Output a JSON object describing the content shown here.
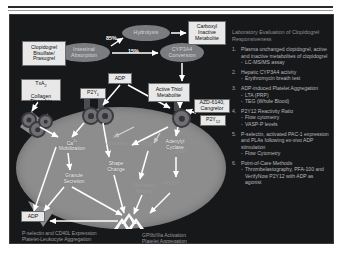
{
  "slide": {
    "background_color": "#17181a",
    "cell_color": "#8d8d8d"
  },
  "pathway": {
    "drug_box": "Clopidogrel\nBisulfate/\nPrasugrel",
    "drug_box_lines": [
      "Clopidogrel",
      "Bisulfate/",
      "Prasugrel"
    ],
    "intestinal": "Intestinal\nAbsorption",
    "hydrolysis": "Hydrolysis",
    "cyp3a4": "CYP3A4\nConversion",
    "carboxyl": "Carboxyl\nInactive\nMetabolite",
    "active_thiol": "Active Thiol\nMetabolite",
    "adp_top": "ADP",
    "adp_bottom": "ADP",
    "azd": "AZD-6140,\nCangrelor",
    "pct_hydrolysis": "85%",
    "pct_cyp": "15%"
  },
  "receptors": {
    "txa2_box": "TxA",
    "txa2_sub": "2",
    "txa2_rest": "Collagen\nThrombin",
    "txa2_lines": [
      "TxA2",
      "Collagen",
      "Thrombin"
    ],
    "p2y1": "P2Y",
    "p2y1_sub": "1",
    "p2y12": "P2Y",
    "p2y12_sub": "12"
  },
  "intracellular": {
    "ca_mobilization": "Ca2+\nMobilization",
    "ca_main": "Ca",
    "ca_sup": "2+",
    "ca_second": "Mobilization",
    "granule_secretion": "Granule\nSecretion",
    "shape_change": "Shape\nChange",
    "adenylyl_cyclase": "Adenylyl\nCyclase",
    "pkc": "PKC\nActivation",
    "pi3k": "PI3K",
    "camp": "cAMP",
    "fibrinogen": "Fibrinogen\nBinding",
    "vasp": "VASP-P",
    "pls": "+"
  },
  "captions": {
    "left": "P-selectin and CD40L Expression\nPlatelet-Leukocyte Aggregation",
    "left_lines": [
      "P-selectin and CD40L Expression",
      "Platelet-Leukocyte Aggregation"
    ],
    "right": "GPIIb/IIIa Activation\nPlatelet Aggregation",
    "right_lines": [
      "GPIIb/IIIa Activation",
      "Platelet Aggregation"
    ]
  },
  "panel": {
    "title": "Laboratory Evaluation of Clopidogrel Responsiveness",
    "items": [
      {
        "text": "Plasma unchanged clopidogrel, active and inactive metabolites of clopidogrel",
        "subs": [
          "LC-MS/MS assay"
        ]
      },
      {
        "text": "Hepatic CYP3A4 activity",
        "subs": [
          "Erythromycin breath test"
        ]
      },
      {
        "text": "ADP-induced Platelet Aggregation",
        "subs": [
          "LTA (PRP)",
          "TEG (Whole Blood)"
        ]
      },
      {
        "text": "P2Y12 Reactivity Ratio",
        "subs": [
          "Flow cytometry",
          "VASP-P levels"
        ]
      },
      {
        "text": "P-selectin, activated PAC-1 expression and PLAs following ex-vivo ADP stimulation",
        "subs": [
          "Flow Cytometry"
        ]
      },
      {
        "text": "Point-of-Care Methods",
        "subs": [
          "Thrombelastography, PFA-100 and VerifyNow P2Y12 with ADP as agonist"
        ]
      }
    ]
  }
}
